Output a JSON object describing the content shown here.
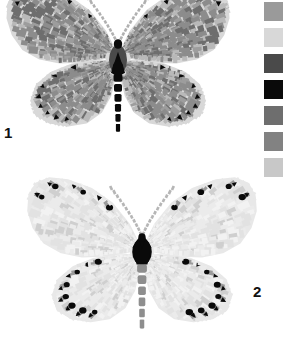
{
  "figure": {
    "type": "scientific-plate",
    "background_color": "#ffffff"
  },
  "specimens": [
    {
      "number": "1",
      "name": "butterfly-1",
      "tone": "dark",
      "wing_fill": "#8c8c8c",
      "wing_fill_alt": "#9d9d9d",
      "wing_fill_dark": "#6e6e6e",
      "wing_fill_light": "#b9b9b9",
      "margin_spot_color": "#0a0a0a",
      "fringe_color": "#d8d8d8",
      "body_thorax_color": "#4a4a4a",
      "body_mark_color": "#0a0a0a",
      "abdomen_color": "#0a0a0a",
      "antenna_color": "#b0b0b0",
      "center_x": 118,
      "center_y": 62,
      "scale": 1.0
    },
    {
      "number": "2",
      "name": "butterfly-2",
      "tone": "light",
      "wing_fill": "#e2e2e2",
      "wing_fill_alt": "#ebebeb",
      "wing_fill_dark": "#cfcfcf",
      "wing_fill_light": "#f2f2f2",
      "margin_spot_color": "#0a0a0a",
      "fringe_color": "#e8e8e8",
      "body_thorax_color": "#0a0a0a",
      "body_mark_color": "#0a0a0a",
      "abdomen_color": "#8e8e8e",
      "antenna_color": "#b6b6b6",
      "center_x": 142,
      "center_y": 258,
      "scale": 1.02
    }
  ],
  "legend": {
    "name": "palette-legend",
    "orientation": "vertical",
    "swatch_count": 7,
    "swatch_size_px": 19,
    "swatches": [
      {
        "index": 1,
        "color": "#9a9a9a",
        "name": "swatch-medium-gray"
      },
      {
        "index": 2,
        "color": "#d8d8d8",
        "name": "swatch-very-light-gray"
      },
      {
        "index": 3,
        "color": "#4a4a4a",
        "name": "swatch-dark-gray"
      },
      {
        "index": 4,
        "color": "#0a0a0a",
        "name": "swatch-black"
      },
      {
        "index": 5,
        "color": "#6e6e6e",
        "name": "swatch-medium-dark-gray"
      },
      {
        "index": 6,
        "color": "#828282",
        "name": "swatch-mid-gray"
      },
      {
        "index": 7,
        "color": "#c8c8c8",
        "name": "swatch-light-gray"
      }
    ]
  },
  "labels": {
    "first": "1",
    "second": "2"
  }
}
